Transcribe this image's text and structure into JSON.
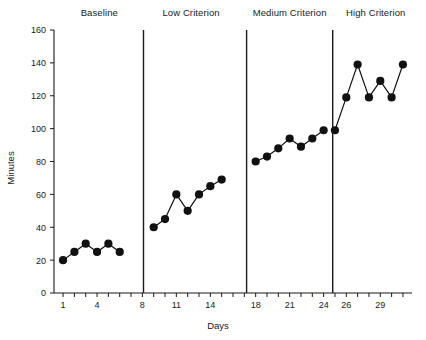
{
  "chart_data": {
    "type": "line",
    "title": "",
    "xlabel": "Days",
    "ylabel": "Minutes",
    "xlim": [
      0.2,
      31.8
    ],
    "ylim": [
      0,
      160
    ],
    "grid": false,
    "legend_position": "none",
    "y_ticks": [
      0,
      20,
      40,
      60,
      80,
      100,
      120,
      140,
      160
    ],
    "y_tick_labels": [
      "0",
      "20",
      "40",
      "60",
      "80",
      "100",
      "120",
      "140",
      "160"
    ],
    "x_ticks": [
      1,
      2,
      3,
      4,
      5,
      6,
      7,
      8,
      9,
      10,
      11,
      12,
      13,
      14,
      15,
      16,
      17,
      18,
      19,
      20,
      21,
      22,
      23,
      24,
      25,
      26,
      27,
      28,
      29,
      30,
      31
    ],
    "x_tick_labels": [
      {
        "x": 1,
        "label": "1"
      },
      {
        "x": 4,
        "label": "4"
      },
      {
        "x": 8,
        "label": "8"
      },
      {
        "x": 11,
        "label": "11"
      },
      {
        "x": 14,
        "label": "14"
      },
      {
        "x": 18,
        "label": "18"
      },
      {
        "x": 21,
        "label": "21"
      },
      {
        "x": 24,
        "label": "24"
      },
      {
        "x": 26,
        "label": "26"
      },
      {
        "x": 29,
        "label": "29"
      }
    ],
    "phases": [
      {
        "name": "Baseline",
        "label_x": 4.2,
        "divider_after": 8.1,
        "x": [
          1,
          2,
          3,
          4,
          5,
          6
        ],
        "y": [
          20,
          25,
          30,
          25,
          30,
          25
        ]
      },
      {
        "name": "Low Criterion",
        "label_x": 12.3,
        "divider_after": 17.2,
        "x": [
          9,
          10,
          11,
          12,
          13,
          14,
          15
        ],
        "y": [
          40,
          45,
          60,
          50,
          60,
          65,
          69
        ]
      },
      {
        "name": "Medium Criterion",
        "label_x": 21.0,
        "divider_after": 24.8,
        "x": [
          18,
          19,
          20,
          21,
          22,
          23,
          24
        ],
        "y": [
          80,
          83,
          88,
          94,
          89,
          94,
          99
        ]
      },
      {
        "name": "High Criterion",
        "label_x": 28.6,
        "divider_after": null,
        "x": [
          25,
          26,
          27,
          28,
          29,
          30,
          31
        ],
        "y": [
          99,
          119,
          139,
          119,
          129,
          119,
          139
        ]
      }
    ],
    "marker": "filled-circle",
    "marker_color": "#111111",
    "line_color": "#111111",
    "axis_color": "#1a1a1a",
    "background_color": "#ffffff"
  },
  "figure": {
    "ylabel_text": "Minutes",
    "xlabel_text": "Days"
  }
}
